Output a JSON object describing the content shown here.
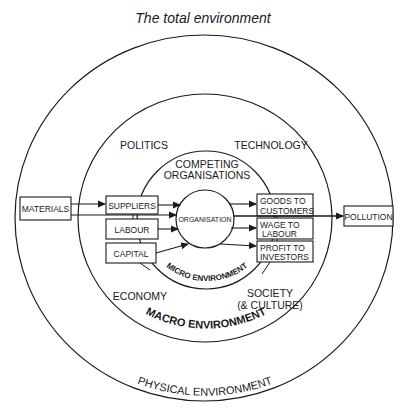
{
  "title": "The total environment",
  "rings": {
    "physical": "PHYSICAL ENVIRONMENT",
    "macro": "MACRO ENVIRONMENT",
    "micro": "MICRO ENVIRONMENT"
  },
  "macro_factors": {
    "politics": "POLITICS",
    "technology": "TECHNOLOGY",
    "economy": "ECONOMY",
    "society_line1": "SOCIETY",
    "society_line2": "(& CULTURE)"
  },
  "micro": {
    "competing_line1": "COMPETING",
    "competing_line2": "ORGANISATIONS",
    "organisation": "ORGANISATION"
  },
  "inputs": {
    "materials": "MATERIALS",
    "suppliers": "SUPPLIERS",
    "labour": "LABOUR",
    "capital": "CAPITAL"
  },
  "outputs": {
    "goods_line1": "GOODS TO",
    "goods_line2": "CUSTOMERS",
    "wage_line1": "WAGE TO",
    "wage_line2": "LABOUR",
    "profit_line1": "PROFIT TO",
    "profit_line2": "INVESTORS",
    "pollution": "POLLUTION"
  },
  "colors": {
    "line": "#1a1a1a",
    "background": "#ffffff"
  }
}
